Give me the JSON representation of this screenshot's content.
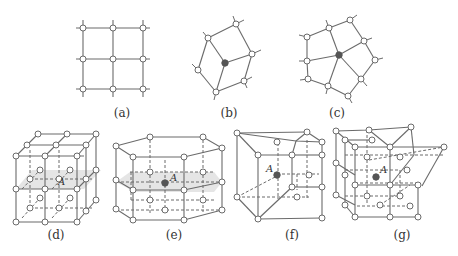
{
  "figure": {
    "panels": [
      {
        "id": "a",
        "label": "(a)",
        "description": "2D square lattice, 3x3 nodes"
      },
      {
        "id": "b",
        "label": "(b)",
        "description": "2D lattice with one atom (filled) coordinated by 3 neighbors"
      },
      {
        "id": "c",
        "label": "(c)",
        "description": "2D lattice with one atom (filled) coordinated by 5 neighbors"
      },
      {
        "id": "d",
        "label": "(d)",
        "description": "3D cubic lattice with shaded plane through atom A",
        "atom_label": "A"
      },
      {
        "id": "e",
        "label": "(e)",
        "description": "3D hexagonal prism lattice with shaded plane through atom A",
        "atom_label": "A"
      },
      {
        "id": "f",
        "label": "(f)",
        "description": "3D distorted lattice with atom A",
        "atom_label": "A"
      },
      {
        "id": "g",
        "label": "(g)",
        "description": "3D lattice with wedge defect and atom A",
        "atom_label": "A"
      }
    ],
    "colors": {
      "line": "#6b6b6b",
      "filled_atom": "#555555",
      "plane_fill": "#dcdcdc",
      "text": "#333333",
      "background": "#ffffff"
    }
  }
}
